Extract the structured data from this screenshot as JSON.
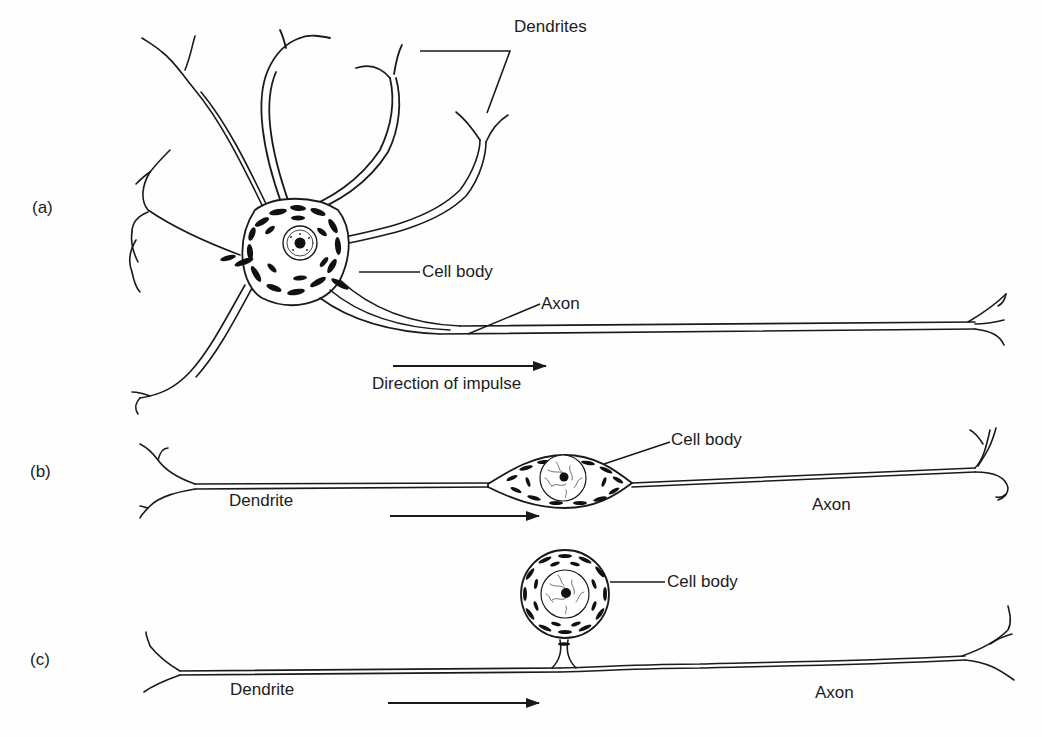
{
  "figure": {
    "panels": [
      {
        "id": "a",
        "marker": "(a)",
        "type": "multipolar neuron",
        "labels": {
          "dendrites": "Dendrites",
          "cell_body": "Cell body",
          "axon": "Axon",
          "direction": "Direction of impulse"
        }
      },
      {
        "id": "b",
        "marker": "(b)",
        "type": "bipolar neuron",
        "labels": {
          "cell_body": "Cell body",
          "dendrite": "Dendrite",
          "axon": "Axon"
        }
      },
      {
        "id": "c",
        "marker": "(c)",
        "type": "unipolar neuron",
        "labels": {
          "cell_body": "Cell body",
          "dendrite": "Dendrite",
          "axon": "Axon"
        }
      }
    ],
    "colors": {
      "ink": "#1a1a1a",
      "background": "#fefefe"
    }
  }
}
